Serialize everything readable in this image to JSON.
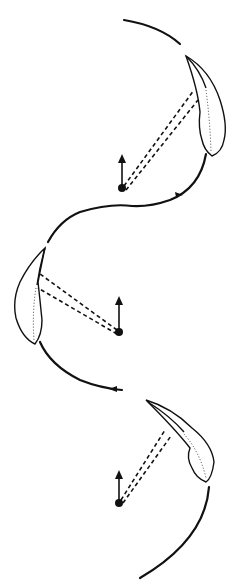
{
  "diagram": {
    "colors": {
      "background": "#ffffff",
      "ink": "#111111"
    },
    "positions": [
      {
        "id": "top",
        "dot": [
          122,
          188
        ],
        "arrow_tip": [
          122,
          156
        ]
      },
      {
        "id": "middle",
        "dot": [
          119,
          332
        ],
        "arrow_tip": [
          119,
          298
        ]
      },
      {
        "id": "bottom",
        "dot": [
          119,
          503
        ],
        "arrow_tip": [
          119,
          472
        ]
      }
    ],
    "labels": []
  }
}
